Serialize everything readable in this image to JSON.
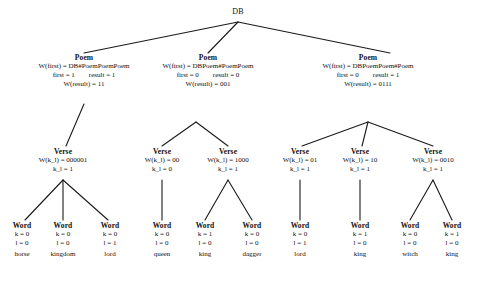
{
  "figure": {
    "type": "derivation-tree",
    "root": {
      "label": "DB",
      "x": 238,
      "y": 10
    },
    "poems": [
      {
        "label": "Poem",
        "x": 84,
        "y": 56,
        "w_first": "W(first) = DB#PoemPoemPoem",
        "first": "first = 1",
        "result": "result = 1",
        "w_result": "W(result) = 11"
      },
      {
        "label": "Poem",
        "x": 208,
        "y": 56,
        "w_first": "W(first) = DBPoem#PoemPoem",
        "first": "first = 0",
        "result": "result = 0",
        "w_result": "W(result) = 001"
      },
      {
        "label": "Poem",
        "x": 360,
        "y": 56,
        "w_first": "W(first) = DBPoemPoem#Poem",
        "first": "first = 0",
        "result": "result = 1",
        "w_result": "W(result) = 0111"
      }
    ],
    "verses": [
      {
        "label": "Verse",
        "x": 63,
        "y": 150,
        "w_kl": "W(k_l) = 000001",
        "kl": "k_l = 1"
      },
      {
        "label": "Verse",
        "x": 162,
        "y": 150,
        "w_kl": "W(k_l) = 00",
        "kl": "k_l = 0"
      },
      {
        "label": "Verse",
        "x": 228,
        "y": 150,
        "w_kl": "W(k_l) = 1000",
        "kl": "k_l = 1"
      },
      {
        "label": "Verse",
        "x": 300,
        "y": 150,
        "w_kl": "W(k_l) = 01",
        "kl": "k_l = 1"
      },
      {
        "label": "Verse",
        "x": 360,
        "y": 150,
        "w_kl": "W(k_l) = 10",
        "kl": "k_l = 1"
      },
      {
        "label": "Verse",
        "x": 433,
        "y": 150,
        "w_kl": "W(k_l) = 0010",
        "kl": "k_l = 1"
      }
    ],
    "words": [
      {
        "label": "Word",
        "x": 22,
        "y": 224,
        "k": "k = 0",
        "l": "l = 0",
        "value": "horse"
      },
      {
        "label": "Word",
        "x": 63,
        "y": 224,
        "k": "k = 0",
        "l": "l = 0",
        "value": "kingdom"
      },
      {
        "label": "Word",
        "x": 110,
        "y": 224,
        "k": "k = 0",
        "l": "l = 1",
        "value": "lord"
      },
      {
        "label": "Word",
        "x": 162,
        "y": 224,
        "k": "k = 0",
        "l": "l = 0",
        "value": "queen"
      },
      {
        "label": "Word",
        "x": 205,
        "y": 224,
        "k": "k = 1",
        "l": "l = 0",
        "value": "king"
      },
      {
        "label": "Word",
        "x": 252,
        "y": 224,
        "k": "k = 0",
        "l": "l = 0",
        "value": "dagger"
      },
      {
        "label": "Word",
        "x": 300,
        "y": 224,
        "k": "k = 0",
        "l": "l = 1",
        "value": "lord"
      },
      {
        "label": "Word",
        "x": 360,
        "y": 224,
        "k": "k = 1",
        "l": "l = 0",
        "value": "king"
      },
      {
        "label": "Word",
        "x": 410,
        "y": 224,
        "k": "k = 0",
        "l": "l = 0",
        "value": "witch"
      },
      {
        "label": "Word",
        "x": 452,
        "y": 224,
        "k": "k = 1",
        "l": "l = 0",
        "value": "king"
      }
    ]
  },
  "colors": {
    "line": "#1a1a1a",
    "text": "#111111",
    "background": "#ffffff"
  }
}
